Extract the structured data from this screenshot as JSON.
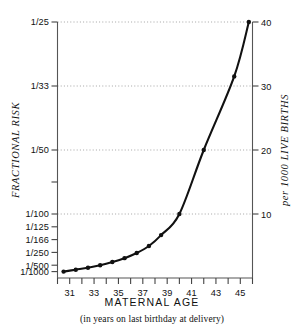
{
  "chart_data": {
    "type": "line",
    "title": "",
    "xlabel": "MATERNAL AGE",
    "xsublabel": "(in years on last birthday at delivery)",
    "ylabel_left": "FRACTIONAL RISK",
    "ylabel_right": "per 1000 LIVE BIRTHS",
    "xlim": [
      30,
      46
    ],
    "ylim": [
      1,
      40
    ],
    "grid": true,
    "legend": null,
    "line_color": "#111111",
    "point_color": "#111111",
    "grid_color": "#9a9a9a",
    "axis_color": "#555555",
    "x_ticks": [
      30,
      31,
      32,
      33,
      34,
      35,
      36,
      37,
      38,
      39,
      40,
      41,
      42,
      43,
      44,
      45,
      46
    ],
    "x_tick_labels": [
      "",
      "31",
      "",
      "33",
      "",
      "35",
      "",
      "37",
      "",
      "39",
      "",
      "41",
      "",
      "43",
      "",
      "45",
      ""
    ],
    "y_ticks_right": [
      10,
      20,
      30,
      40
    ],
    "y_tick_labels_right": [
      "10",
      "20",
      "30",
      "40"
    ],
    "y_ticks_left_rate": [
      40,
      30,
      20,
      15,
      10,
      8,
      6,
      4,
      2,
      1
    ],
    "y_tick_labels_left": [
      "1/25",
      "1/33",
      "1/50",
      "",
      "1/100",
      "1/125",
      "1/166",
      "1/250",
      "1/500",
      "1/1000"
    ],
    "gridline_rates": [
      40,
      30,
      20,
      10
    ],
    "x": [
      30.5,
      31.5,
      32.5,
      33.5,
      34.5,
      35.5,
      36.5,
      37.5,
      38.5,
      40.0,
      42.0,
      44.5,
      45.7
    ],
    "values": [
      1.0,
      1.3,
      1.6,
      2.0,
      2.5,
      3.1,
      3.9,
      5.0,
      6.7,
      10.0,
      20.0,
      31.5,
      40.0
    ],
    "series": [
      {
        "name": "risk per 1000 live births",
        "x": [
          30.5,
          31.5,
          32.5,
          33.5,
          34.5,
          35.5,
          36.5,
          37.5,
          38.5,
          40.0,
          42.0,
          44.5,
          45.7
        ],
        "values": [
          1.0,
          1.3,
          1.6,
          2.0,
          2.5,
          3.1,
          3.9,
          5.0,
          6.7,
          10.0,
          20.0,
          31.5,
          40.0
        ]
      }
    ]
  }
}
